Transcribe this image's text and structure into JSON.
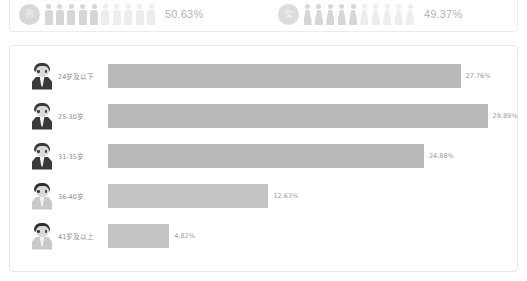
{
  "gender": {
    "male": {
      "icon_label": "男",
      "percent": "50.63%",
      "value": 50.63,
      "icon_total": 10,
      "icon_filled": 5
    },
    "female": {
      "icon_label": "女",
      "percent": "49.37%",
      "value": 49.37,
      "icon_total": 10,
      "icon_filled": 5
    }
  },
  "colors": {
    "bar": "#b9b9b9",
    "bar_light": "#c3c3c3",
    "icon_filled": "#d6d6d6",
    "icon_empty": "#ededed",
    "text": "#9a9a9a",
    "panel_border": "#e8e8e8"
  },
  "chart_data": {
    "type": "bar",
    "orientation": "horizontal",
    "title": "",
    "xlabel": "",
    "ylabel": "",
    "categories": [
      "24岁及以下",
      "25-30岁",
      "31-35岁",
      "36-40岁",
      "41岁及以上"
    ],
    "values": [
      27.76,
      29.89,
      24.88,
      12.63,
      4.82
    ],
    "value_labels": [
      "27.76%",
      "29.89%",
      "24.88%",
      "12.63%",
      "4.82%"
    ],
    "xlim": [
      0,
      30
    ],
    "grid": false,
    "legend": false
  },
  "age_rows": [
    {
      "label": "24岁及以下",
      "value": 27.76,
      "value_label": "27.76%"
    },
    {
      "label": "25-30岁",
      "value": 29.89,
      "value_label": "29.89%"
    },
    {
      "label": "31-35岁",
      "value": 24.88,
      "value_label": "24.88%"
    },
    {
      "label": "36-40岁",
      "value": 12.63,
      "value_label": "12.63%"
    },
    {
      "label": "41岁及以上",
      "value": 4.82,
      "value_label": "4.82%"
    }
  ]
}
